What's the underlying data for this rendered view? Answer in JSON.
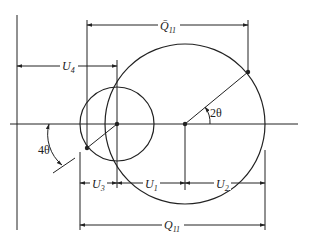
{
  "diagram": {
    "labels": {
      "q11_bar": "Q̄",
      "q11_bar_sub": "11",
      "u4": "U",
      "u4_sub": "4",
      "u3": "U",
      "u3_sub": "3",
      "u1": "U",
      "u1_sub": "1",
      "u2": "U",
      "u2_sub": "2",
      "q11": "Q",
      "q11_sub": "11",
      "angle_2theta": "2θ",
      "angle_4theta": "4θ"
    },
    "colors": {
      "stroke": "#222222",
      "background": "#ffffff"
    }
  }
}
